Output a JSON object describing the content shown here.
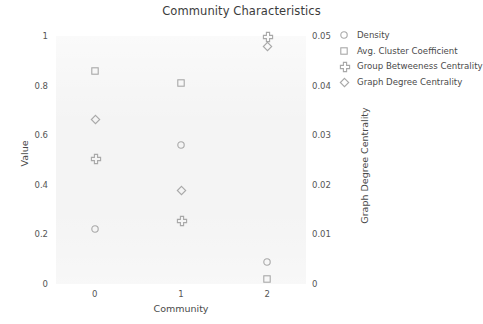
{
  "chart_data": {
    "type": "scatter",
    "title": "Community Characteristics",
    "xlabel": "Community",
    "ylabel": "Value",
    "y2label": "Graph Degree Centrality",
    "categories": [
      "0",
      "1",
      "2"
    ],
    "x": [
      0,
      1,
      2
    ],
    "xlim": [
      -0.45,
      2.45
    ],
    "ylim": [
      0,
      1
    ],
    "y2lim": [
      0,
      0.05
    ],
    "yticks": [
      "0",
      "0.2",
      "0.4",
      "0.6",
      "0.8",
      "1"
    ],
    "ytick_values": [
      0,
      0.2,
      0.4,
      0.6,
      0.8,
      1
    ],
    "y2ticks": [
      "0",
      "0.01",
      "0.02",
      "0.03",
      "0.04",
      "0.05"
    ],
    "y2tick_values": [
      0,
      0.01,
      0.02,
      0.03,
      0.04,
      0.05
    ],
    "xticks": [
      "0",
      "1",
      "2"
    ],
    "grid": false,
    "legend_position": "upper right outside",
    "marker_color": "#a8a8a8",
    "plot_background": "#f4f4f4",
    "series": [
      {
        "name": "Density",
        "marker": "circle",
        "axis": "left",
        "values": [
          0.22,
          0.56,
          0.09
        ]
      },
      {
        "name": "Avg. Cluster Coefficient",
        "marker": "square",
        "axis": "left",
        "values": [
          0.86,
          0.81,
          0.02
        ]
      },
      {
        "name": "Group Betweeness Centrality",
        "marker": "plus",
        "axis": "left",
        "values": [
          0.51,
          0.26,
          1.0
        ]
      },
      {
        "name": "Graph Degree Centrality",
        "marker": "diamond",
        "axis": "right",
        "values": [
          0.0333,
          0.019,
          0.048
        ]
      }
    ]
  }
}
